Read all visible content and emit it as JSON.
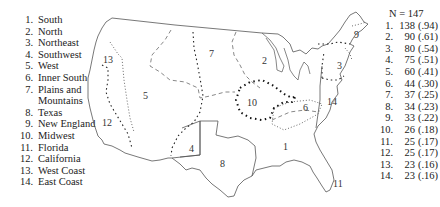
{
  "legend": {
    "items": [
      {
        "num": "1.",
        "label": "South"
      },
      {
        "num": "2.",
        "label": "North"
      },
      {
        "num": "3.",
        "label": "Northeast"
      },
      {
        "num": "4.",
        "label": "Southwest"
      },
      {
        "num": "5.",
        "label": "West"
      },
      {
        "num": "6.",
        "label": "Inner South"
      },
      {
        "num": "7.",
        "label": "Plains and"
      },
      {
        "num": "",
        "label": "Mountains"
      },
      {
        "num": "8.",
        "label": "Texas"
      },
      {
        "num": "9.",
        "label": "New England"
      },
      {
        "num": "10.",
        "label": "Midwest"
      },
      {
        "num": "11.",
        "label": "Florida"
      },
      {
        "num": "12.",
        "label": "California"
      },
      {
        "num": "13.",
        "label": "West Coast"
      },
      {
        "num": "14.",
        "label": "East Coast"
      }
    ]
  },
  "counts": {
    "header": "N = 147",
    "rows": [
      {
        "num": "1.",
        "count": "138",
        "prop": "(.94)"
      },
      {
        "num": "2.",
        "count": "90",
        "prop": "(.61)"
      },
      {
        "num": "3.",
        "count": "80",
        "prop": "(.54)"
      },
      {
        "num": "4.",
        "count": "75",
        "prop": "(.51)"
      },
      {
        "num": "5.",
        "count": "60",
        "prop": "(.41)"
      },
      {
        "num": "6.",
        "count": "44",
        "prop": "(.30)"
      },
      {
        "num": "7.",
        "count": "37",
        "prop": "(.25)"
      },
      {
        "num": "8.",
        "count": "34",
        "prop": "(.23)"
      },
      {
        "num": "9.",
        "count": "33",
        "prop": "(.22)"
      },
      {
        "num": "10.",
        "count": "26",
        "prop": "(.18)"
      },
      {
        "num": "11.",
        "count": "25",
        "prop": "(.17)"
      },
      {
        "num": "12.",
        "count": "25",
        "prop": "(.17)"
      },
      {
        "num": "13.",
        "count": "23",
        "prop": "(.16)"
      },
      {
        "num": "14.",
        "count": "23",
        "prop": "(.16)"
      }
    ]
  },
  "map": {
    "region_labels": [
      {
        "id": "1",
        "text": "1"
      },
      {
        "id": "2",
        "text": "2"
      },
      {
        "id": "3",
        "text": "3"
      },
      {
        "id": "4",
        "text": "4"
      },
      {
        "id": "5",
        "text": "5"
      },
      {
        "id": "6",
        "text": "6"
      },
      {
        "id": "7",
        "text": "7"
      },
      {
        "id": "8",
        "text": "8"
      },
      {
        "id": "9",
        "text": "9"
      },
      {
        "id": "10",
        "text": "10"
      },
      {
        "id": "11",
        "text": "11"
      },
      {
        "id": "12",
        "text": "12"
      },
      {
        "id": "13",
        "text": "13"
      },
      {
        "id": "14",
        "text": "14"
      }
    ]
  }
}
